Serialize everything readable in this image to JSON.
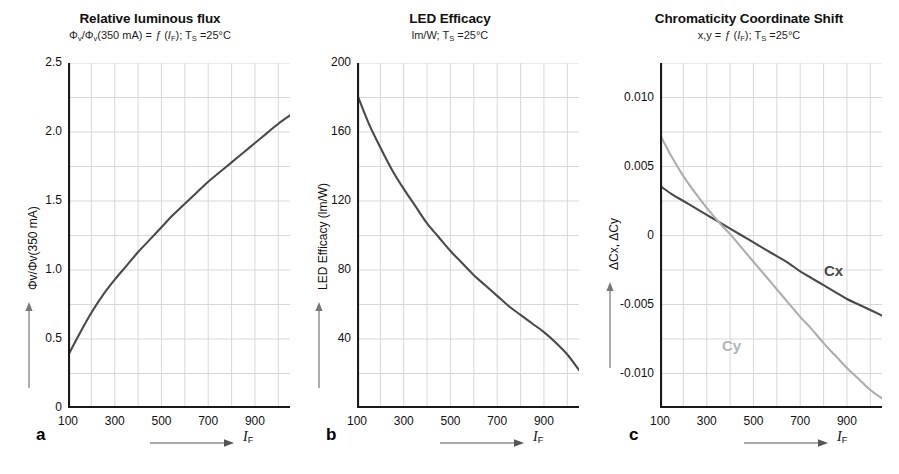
{
  "figure": {
    "panels": [
      {
        "letter": "a",
        "title": "Relative luminous flux",
        "subtitle_prefix": "Φ",
        "subtitle_full": "Φv/Φv(350 mA) = ƒ (IF); TS =25°C",
        "ylabel": "Φv/Φv(350 mA)",
        "xlabel_symbol": "I",
        "xlabel_sub": "F"
      },
      {
        "letter": "b",
        "title": "LED Efficacy",
        "subtitle_full": "lm/W; TS =25°C",
        "ylabel": "LED Efficacy (lm/W)",
        "xlabel_symbol": "I",
        "xlabel_sub": "F"
      },
      {
        "letter": "c",
        "title": "Chromaticity Coordinate Shift",
        "subtitle_full": "x,y = ƒ (IF); TS =25°C",
        "ylabel": "ΔCx, ΔCy",
        "xlabel_symbol": "I",
        "xlabel_sub": "F"
      }
    ],
    "colors": {
      "curve_dark": "#4a4a4a",
      "curve_light": "#adadad",
      "grid": "#d8d8dc",
      "axis": "#1a1a1a",
      "text": "#111111"
    }
  },
  "chart_data": [
    {
      "type": "line",
      "title": "Relative luminous flux",
      "subtitle": "Φv/Φv(350 mA) = ƒ (IF); TS =25°C",
      "xlabel": "IF",
      "ylabel": "Φv/Φv(350 mA)",
      "xlim": [
        100,
        1050
      ],
      "ylim": [
        0,
        2.5
      ],
      "xticks": [
        100,
        300,
        500,
        700,
        900
      ],
      "yticks": [
        0,
        0.5,
        1.0,
        1.5,
        2.0,
        2.5
      ],
      "ytick_labels": [
        "0",
        "0.5",
        "1.0",
        "1.5",
        "2.0",
        "2.5"
      ],
      "grid": true,
      "legend": "none",
      "series": [
        {
          "name": "Relative luminous flux",
          "color": "#4a4a4a",
          "x": [
            100,
            150,
            200,
            250,
            300,
            350,
            400,
            450,
            500,
            550,
            600,
            650,
            700,
            750,
            800,
            850,
            900,
            950,
            1000,
            1050
          ],
          "values": [
            0.38,
            0.54,
            0.69,
            0.82,
            0.93,
            1.03,
            1.13,
            1.22,
            1.31,
            1.4,
            1.48,
            1.56,
            1.64,
            1.71,
            1.78,
            1.85,
            1.92,
            1.99,
            2.06,
            2.12
          ]
        }
      ]
    },
    {
      "type": "line",
      "title": "LED Efficacy",
      "subtitle": "lm/W; TS =25°C",
      "xlabel": "IF",
      "ylabel": "LED Efficacy (lm/W)",
      "xlim": [
        100,
        1050
      ],
      "ylim": [
        0,
        200
      ],
      "xticks": [
        100,
        300,
        500,
        700,
        900
      ],
      "yticks": [
        40,
        80,
        120,
        160,
        200
      ],
      "ytick_labels": [
        "40",
        "80",
        "120",
        "160",
        "200"
      ],
      "grid": true,
      "legend": "none",
      "series": [
        {
          "name": "LED Efficacy",
          "color": "#4a4a4a",
          "x": [
            100,
            150,
            200,
            250,
            300,
            350,
            400,
            450,
            500,
            550,
            600,
            650,
            700,
            750,
            800,
            850,
            900,
            950,
            1000,
            1050
          ],
          "values": [
            182,
            165,
            151,
            138,
            127,
            117,
            107,
            99,
            91,
            84,
            77,
            71,
            65,
            59,
            54,
            49,
            44,
            38,
            31,
            22
          ]
        }
      ]
    },
    {
      "type": "line",
      "title": "Chromaticity Coordinate Shift",
      "subtitle": "x,y = ƒ (IF); TS =25°C",
      "xlabel": "IF",
      "ylabel": "ΔCx, ΔCy",
      "xlim": [
        100,
        1050
      ],
      "ylim": [
        -0.0125,
        0.0125
      ],
      "xticks": [
        100,
        300,
        500,
        700,
        900
      ],
      "yticks": [
        0.01,
        0.005,
        0,
        -0.005,
        -0.01
      ],
      "ytick_labels": [
        "0.010",
        "0.005",
        "0",
        "-0.005",
        "-0.010"
      ],
      "grid": true,
      "legend": "inline-labels",
      "series": [
        {
          "name": "Cx",
          "label": "Cx",
          "color": "#4a4a4a",
          "x": [
            100,
            150,
            200,
            250,
            300,
            350,
            400,
            450,
            500,
            550,
            600,
            650,
            700,
            750,
            800,
            850,
            900,
            950,
            1000,
            1050
          ],
          "values": [
            0.0036,
            0.003,
            0.0025,
            0.002,
            0.0015,
            0.001,
            0.0005,
            0.0,
            -0.0005,
            -0.001,
            -0.0015,
            -0.002,
            -0.0026,
            -0.0031,
            -0.0036,
            -0.0041,
            -0.0046,
            -0.005,
            -0.0054,
            -0.0058
          ]
        },
        {
          "name": "Cy",
          "label": "Cy",
          "color": "#adadad",
          "x": [
            100,
            150,
            200,
            250,
            300,
            350,
            400,
            450,
            500,
            550,
            600,
            650,
            700,
            750,
            800,
            850,
            900,
            950,
            1000,
            1050
          ],
          "values": [
            0.0073,
            0.0057,
            0.0043,
            0.0031,
            0.002,
            0.001,
            0.0001,
            -0.0009,
            -0.0019,
            -0.0029,
            -0.0039,
            -0.0049,
            -0.0059,
            -0.0068,
            -0.0078,
            -0.0087,
            -0.0096,
            -0.0104,
            -0.0112,
            -0.0118
          ]
        }
      ]
    }
  ]
}
